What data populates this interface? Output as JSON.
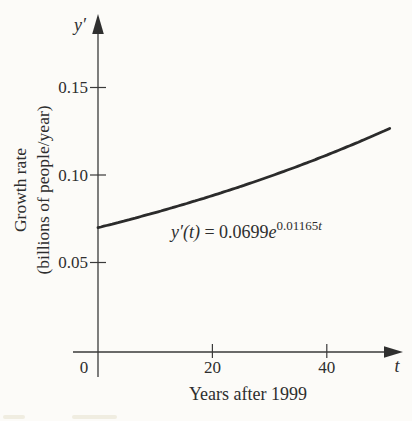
{
  "figure": {
    "y_axis": {
      "symbol": "y′",
      "tick_labels": [
        "0.15",
        "0.10",
        "0.05"
      ],
      "title_line1": "Growth rate",
      "title_line2": "(billions of people/year)"
    },
    "x_axis": {
      "symbol": "t",
      "origin_label": "0",
      "tick_labels": [
        "20",
        "40"
      ],
      "title": "Years after 1999"
    },
    "equation": {
      "lhs": "y′(t)",
      "equals": " = ",
      "coefficient": "0.0699",
      "base": "e",
      "exponent_coeff": "0.01165",
      "exponent_var": "t"
    }
  },
  "chart_data": {
    "type": "line",
    "title": "",
    "xlabel": "Years after 1999",
    "ylabel": "Growth rate (billions of people/year)",
    "x_axis_symbol": "t",
    "y_axis_symbol": "y′",
    "xlim": [
      0,
      53
    ],
    "ylim": [
      0,
      0.175
    ],
    "x_ticks": [
      0,
      20,
      40
    ],
    "y_ticks": [
      0.05,
      0.1,
      0.15
    ],
    "grid": false,
    "legend": "none",
    "annotation": "y′(t) = 0.0699e^(0.01165t)",
    "function": {
      "form": "y = a*exp(b*t)",
      "coefficient": 0.0699,
      "exponent_rate": 0.01165,
      "t_domain": [
        0,
        51.2
      ]
    },
    "series": [
      {
        "name": "y′(t)",
        "x": [
          0,
          5,
          10,
          15,
          20,
          25,
          30,
          35,
          40,
          45,
          50
        ],
        "y": [
          0.0699,
          0.0741,
          0.0785,
          0.0832,
          0.0882,
          0.0935,
          0.0991,
          0.1051,
          0.1114,
          0.1181,
          0.1252
        ]
      }
    ],
    "colors": {
      "curve": "#2b2b2b",
      "axis": "#3a3a3a",
      "background": "#fcfbf8"
    }
  }
}
